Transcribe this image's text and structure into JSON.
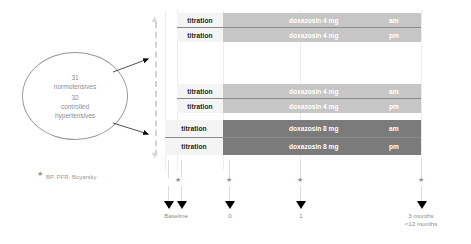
{
  "diagram": {
    "cohort": {
      "groups": [
        {
          "count": "31",
          "label": "normotensives"
        },
        {
          "count": "32",
          "label": "controlled\nhypertensives"
        }
      ],
      "count_1": "31",
      "label_1": "normotensives",
      "count_2": "32",
      "label_2a": "controlled",
      "label_2b": "hypertensives"
    },
    "arrows": {
      "upper": "arrow-to-randomisation-upper",
      "lower": "arrow-to-randomisation-lower"
    },
    "randomisation": {
      "top_cap": "▲",
      "bottom_cap": "▼"
    },
    "treatment_rows": [
      {
        "id": "row-1",
        "titration": "titration",
        "drug": "doxazosin 4 mg",
        "period": "am",
        "shade": "light"
      },
      {
        "id": "row-2",
        "titration": "titration",
        "drug": "doxazosin 4 mg",
        "period": "pm",
        "shade": "light"
      },
      {
        "id": "row-3",
        "titration": "titration",
        "drug": "doxazosin 4 mg",
        "period": "am",
        "shade": "light"
      },
      {
        "id": "row-4",
        "titration": "titration",
        "drug": "doxazosin 4 mg",
        "period": "pm",
        "shade": "light"
      },
      {
        "id": "row-5",
        "titration": "titration",
        "drug": "doxazosin 8 mg",
        "period": "am",
        "shade": "dark"
      },
      {
        "id": "row-6",
        "titration": "titration",
        "drug": "doxazosin 8 mg",
        "period": "pm",
        "shade": "dark"
      }
    ],
    "timeline": {
      "star_glyph": "★",
      "markers": [
        {
          "id": "marker-baseline-a",
          "label": ""
        },
        {
          "id": "marker-baseline-b",
          "label": "Baseline"
        },
        {
          "id": "marker-0",
          "label": "0"
        },
        {
          "id": "marker-1",
          "label": "1"
        },
        {
          "id": "marker-3-months",
          "label": "3 months",
          "label2": "<12 months"
        }
      ],
      "label_baseline": "Baseline",
      "label_zero": "0",
      "label_one": "1",
      "label_three_months": "3 months",
      "label_under_twelve": "<12 months"
    },
    "footnote": {
      "marker": "★",
      "text": "BP, PFR, Boyarsky"
    },
    "colors": {
      "light_bar": "#c6c6c6",
      "dark_bar": "#7b7b7b",
      "titration_bg": "#f4f4f4",
      "text_grey": "#8d8d8d",
      "rule": "#8a8a8a",
      "gridline": "#ededed",
      "dashed_line": "#d2d2d2"
    }
  }
}
